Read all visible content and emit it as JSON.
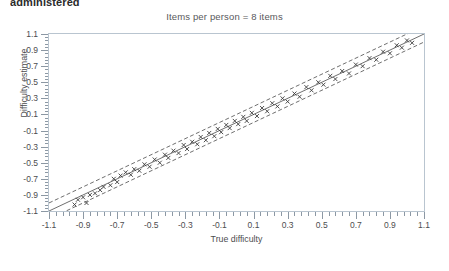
{
  "header": {
    "partial_text": "administered"
  },
  "chart_data": {
    "type": "scatter",
    "title": "Items per person = 8 items",
    "xlabel": "True difficulty",
    "ylabel": "Difficulty estimate",
    "xlim": [
      -1.1,
      1.1
    ],
    "ylim": [
      -1.1,
      1.1
    ],
    "xticks": [
      -1.1,
      -0.9,
      -0.7,
      -0.5,
      -0.3,
      -0.1,
      0.1,
      0.3,
      0.5,
      0.7,
      0.9,
      1.1
    ],
    "yticks": [
      1.1,
      0.9,
      0.7,
      0.5,
      0.3,
      0.1,
      -0.1,
      -0.3,
      -0.5,
      -0.7,
      -0.9,
      -1.1
    ],
    "xtick_labels": [
      "-1.1",
      "-0.9",
      "-0.7",
      "-0.5",
      "-0.3",
      "-0.1",
      "0.1",
      "0.3",
      "0.5",
      "0.7",
      "0.9",
      "1.1"
    ],
    "ytick_labels": [
      "1.1",
      "0.9",
      "0.7",
      "0.5",
      "0.3",
      "0.1",
      "-0.1",
      "-0.3",
      "-0.5",
      "-0.7",
      "-0.9",
      "-1.1"
    ],
    "minor_ticks_per_major": 5,
    "grid": false,
    "legend": null,
    "marker": {
      "shape": "cross",
      "color": "#3b3b3b",
      "size": 4
    },
    "reference_lines": [
      {
        "name": "identity",
        "style": "solid",
        "color": "#4a4a4a",
        "slope": 1,
        "intercept": 0
      },
      {
        "name": "upper-band",
        "style": "dashed",
        "color": "#4a4a4a",
        "slope": 1,
        "intercept": 0.1
      },
      {
        "name": "lower-band",
        "style": "dashed",
        "color": "#4a4a4a",
        "slope": 1,
        "intercept": -0.1
      }
    ],
    "points": [
      [
        -0.95,
        -1.02
      ],
      [
        -0.93,
        -0.96
      ],
      [
        -0.9,
        -0.93
      ],
      [
        -0.88,
        -1.0
      ],
      [
        -0.86,
        -0.9
      ],
      [
        -0.83,
        -0.88
      ],
      [
        -0.8,
        -0.84
      ],
      [
        -0.78,
        -0.8
      ],
      [
        -0.74,
        -0.78
      ],
      [
        -0.72,
        -0.7
      ],
      [
        -0.7,
        -0.74
      ],
      [
        -0.68,
        -0.66
      ],
      [
        -0.65,
        -0.62
      ],
      [
        -0.62,
        -0.65
      ],
      [
        -0.6,
        -0.58
      ],
      [
        -0.57,
        -0.6
      ],
      [
        -0.54,
        -0.52
      ],
      [
        -0.51,
        -0.55
      ],
      [
        -0.48,
        -0.46
      ],
      [
        -0.45,
        -0.5
      ],
      [
        -0.42,
        -0.4
      ],
      [
        -0.4,
        -0.44
      ],
      [
        -0.37,
        -0.35
      ],
      [
        -0.34,
        -0.38
      ],
      [
        -0.31,
        -0.28
      ],
      [
        -0.29,
        -0.33
      ],
      [
        -0.26,
        -0.24
      ],
      [
        -0.23,
        -0.27
      ],
      [
        -0.21,
        -0.18
      ],
      [
        -0.18,
        -0.22
      ],
      [
        -0.16,
        -0.13
      ],
      [
        -0.13,
        -0.17
      ],
      [
        -0.11,
        -0.08
      ],
      [
        -0.09,
        -0.12
      ],
      [
        -0.06,
        -0.03
      ],
      [
        -0.04,
        -0.07
      ],
      [
        -0.01,
        0.02
      ],
      [
        0.01,
        -0.02
      ],
      [
        0.04,
        0.07
      ],
      [
        0.06,
        0.02
      ],
      [
        0.09,
        0.12
      ],
      [
        0.12,
        0.08
      ],
      [
        0.15,
        0.18
      ],
      [
        0.18,
        0.14
      ],
      [
        0.21,
        0.24
      ],
      [
        0.24,
        0.2
      ],
      [
        0.27,
        0.3
      ],
      [
        0.3,
        0.26
      ],
      [
        0.34,
        0.36
      ],
      [
        0.37,
        0.32
      ],
      [
        0.41,
        0.44
      ],
      [
        0.44,
        0.4
      ],
      [
        0.48,
        0.5
      ],
      [
        0.51,
        0.47
      ],
      [
        0.55,
        0.58
      ],
      [
        0.58,
        0.54
      ],
      [
        0.62,
        0.64
      ],
      [
        0.66,
        0.61
      ],
      [
        0.7,
        0.72
      ],
      [
        0.74,
        0.7
      ],
      [
        0.78,
        0.8
      ],
      [
        0.82,
        0.78
      ],
      [
        0.86,
        0.88
      ],
      [
        0.9,
        0.86
      ],
      [
        0.94,
        0.96
      ],
      [
        0.97,
        0.93
      ],
      [
        1.0,
        1.02
      ],
      [
        1.03,
        0.99
      ]
    ]
  }
}
